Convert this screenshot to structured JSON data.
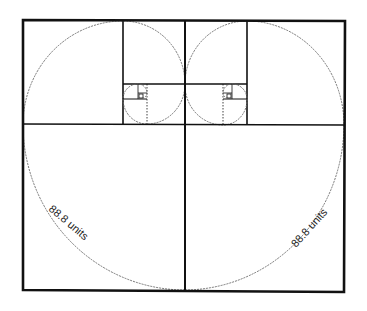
{
  "diagram": {
    "labels": {
      "left_arc": "88.8 units",
      "right_arc": "88.8 units"
    },
    "colors": {
      "line": "#111111",
      "spiral": "#666666",
      "background": "#ffffff"
    }
  }
}
